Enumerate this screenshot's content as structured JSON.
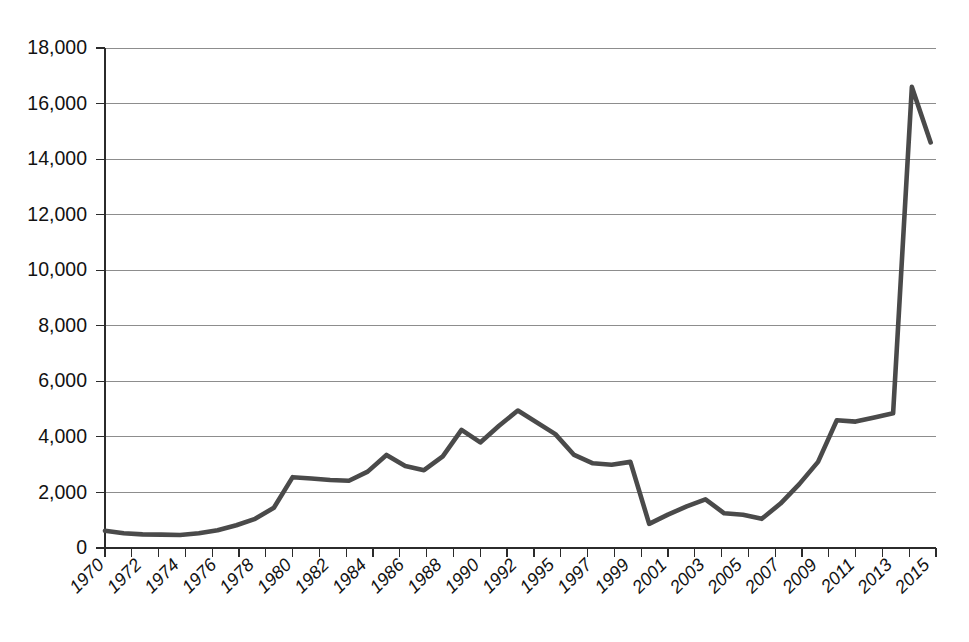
{
  "chart_data": {
    "type": "line",
    "title": "",
    "subtitle": "",
    "xlabel": "",
    "ylabel": "",
    "ylim": [
      0,
      18000
    ],
    "ytick_labels": [
      "0",
      "2,000",
      "4,000",
      "6,000",
      "8,000",
      "10,000",
      "12,000",
      "14,000",
      "16,000",
      "18,000"
    ],
    "ytick_values": [
      0,
      2000,
      4000,
      6000,
      8000,
      10000,
      12000,
      14000,
      16000,
      18000
    ],
    "grid": true,
    "legend": "none",
    "legend_entries": [],
    "annotations": [],
    "x": [
      "1970",
      "1971",
      "1972",
      "1973",
      "1974",
      "1975",
      "1976",
      "1977",
      "1978",
      "1979",
      "1980",
      "1981",
      "1982",
      "1983",
      "1984",
      "1985",
      "1986",
      "1987",
      "1988",
      "1989",
      "1990",
      "1991",
      "1992",
      "1995",
      "1996",
      "1997",
      "1998",
      "1999",
      "2000",
      "2001",
      "2002",
      "2003",
      "2004",
      "2005",
      "2006",
      "2007",
      "2008",
      "2009",
      "2010",
      "2011",
      "2012",
      "2013",
      "2014",
      "2015"
    ],
    "xtick_labels": [
      "1970",
      "1972",
      "1974",
      "1976",
      "1978",
      "1980",
      "1982",
      "1984",
      "1986",
      "1988",
      "1990",
      "1992",
      "1995",
      "1997",
      "1999",
      "2001",
      "2003",
      "2005",
      "2007",
      "2009",
      "2011",
      "2013",
      "2015"
    ],
    "categories": [
      "1970",
      "1971",
      "1972",
      "1973",
      "1974",
      "1975",
      "1976",
      "1977",
      "1978",
      "1979",
      "1980",
      "1981",
      "1982",
      "1983",
      "1984",
      "1985",
      "1986",
      "1987",
      "1988",
      "1989",
      "1990",
      "1991",
      "1992",
      "1995",
      "1996",
      "1997",
      "1998",
      "1999",
      "2000",
      "2001",
      "2002",
      "2003",
      "2004",
      "2005",
      "2006",
      "2007",
      "2008",
      "2009",
      "2010",
      "2011",
      "2012",
      "2013",
      "2014",
      "2015"
    ],
    "values": [
      620,
      530,
      490,
      480,
      470,
      530,
      640,
      820,
      1050,
      1450,
      2550,
      2500,
      2450,
      2420,
      2750,
      3350,
      2950,
      2800,
      3300,
      4250,
      3800,
      4400,
      4950,
      4100,
      3350,
      3050,
      3000,
      3100,
      870,
      1200,
      1500,
      1750,
      1250,
      1200,
      1050,
      1600,
      2300,
      3100,
      4600,
      4550,
      4700,
      4850,
      16600,
      14600
    ],
    "series": [
      {
        "name": "series-1",
        "color": "#4a4a4a",
        "values": [
          620,
          530,
          490,
          480,
          470,
          530,
          640,
          820,
          1050,
          1450,
          2550,
          2500,
          2450,
          2420,
          2750,
          3350,
          2950,
          2800,
          3300,
          4250,
          3800,
          4400,
          4950,
          4100,
          3350,
          3050,
          3000,
          3100,
          870,
          1200,
          1500,
          1750,
          1250,
          1200,
          1050,
          1600,
          2300,
          3100,
          4600,
          4550,
          4700,
          4850,
          16600,
          14600
        ]
      }
    ]
  },
  "style": {
    "line_color": "#4a4a4a",
    "grid_color": "#8d8d8d",
    "axis_color": "#2b2b2b",
    "background": "#ffffff",
    "text_color": "#121212"
  }
}
